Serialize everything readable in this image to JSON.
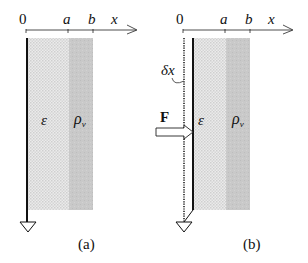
{
  "figure": {
    "panels": [
      {
        "id": "a",
        "caption": "(a)",
        "axis": {
          "origin_label": "0",
          "tick_a_label": "a",
          "tick_b_label": "b",
          "axis_label": "x"
        },
        "region_labels": {
          "dielectric": "ε",
          "charge": "ρ",
          "charge_sub": "v"
        },
        "has_displacement": false
      },
      {
        "id": "b",
        "caption": "(b)",
        "axis": {
          "origin_label": "0",
          "tick_a_label": "a",
          "tick_b_label": "b",
          "axis_label": "x"
        },
        "region_labels": {
          "dielectric": "ε",
          "charge": "ρ",
          "charge_sub": "v"
        },
        "displacement_label": "δx",
        "force_label": "F",
        "has_displacement": true
      }
    ],
    "colors": {
      "dielectric_fill": "#e3e3e3",
      "charge_fill": "#c6c6c6",
      "line": "#111111"
    },
    "icons": [
      "ground-icon",
      "force-arrow-icon"
    ]
  }
}
